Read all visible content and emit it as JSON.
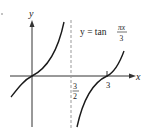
{
  "figure": {
    "function_label": {
      "lhs": "y = tan",
      "numerator": "πx",
      "denominator": "3"
    },
    "axes": {
      "x_label": "x",
      "y_label": "y"
    },
    "asymptote_label": {
      "numerator": "3",
      "denominator": "2"
    },
    "tick_label_3": "3",
    "colors": {
      "curve": "#1a1a1a",
      "axis": "#333333",
      "asymptote": "#999999"
    }
  }
}
